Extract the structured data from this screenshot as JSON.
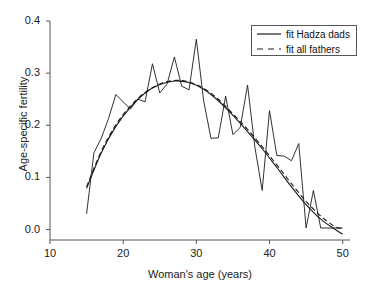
{
  "chart_data": {
    "type": "line",
    "title": "",
    "xlabel": "Woman's age (years)",
    "ylabel": "Age-specific fertility",
    "xlim": [
      10,
      51
    ],
    "ylim": [
      -0.02,
      0.4
    ],
    "xticks": [
      10,
      20,
      30,
      40,
      50
    ],
    "xtick_labels": [
      "10",
      "20",
      "30",
      "40",
      "50"
    ],
    "yticks": [
      0.0,
      0.1,
      0.2,
      0.3,
      0.4
    ],
    "ytick_labels": [
      "0.0",
      "0.1",
      "0.2",
      "0.3",
      "0.4"
    ],
    "grid": false,
    "legend_position": "top-right",
    "legend": [
      {
        "label": "fit Hadza dads",
        "style": "solid"
      },
      {
        "label": "fit all fathers",
        "style": "dashed"
      }
    ],
    "series": [
      {
        "name": "observed age-specific fertility",
        "style": "solid-jagged",
        "x": [
          15,
          16,
          17,
          18,
          19,
          20,
          21,
          22,
          23,
          24,
          25,
          26,
          27,
          28,
          29,
          30,
          31,
          32,
          33,
          34,
          35,
          36,
          37,
          38,
          39,
          40,
          41,
          42,
          43,
          44,
          45,
          46,
          47,
          48,
          49,
          50
        ],
        "y": [
          0.03,
          0.147,
          0.175,
          0.213,
          0.259,
          0.245,
          0.231,
          0.25,
          0.245,
          0.318,
          0.262,
          0.279,
          0.331,
          0.275,
          0.268,
          0.365,
          0.247,
          0.175,
          0.176,
          0.256,
          0.182,
          0.196,
          0.277,
          0.158,
          0.075,
          0.228,
          0.142,
          0.141,
          0.132,
          0.165,
          0.003,
          0.075,
          0.003,
          0.003,
          0.003,
          0.003
        ]
      },
      {
        "name": "fit Hadza dads",
        "style": "solid",
        "x": [
          15,
          17,
          19,
          21,
          23,
          25,
          27,
          29,
          31,
          33,
          35,
          37,
          39,
          41,
          43,
          45,
          47,
          49,
          50
        ],
        "y": [
          0.079,
          0.147,
          0.198,
          0.235,
          0.262,
          0.278,
          0.285,
          0.282,
          0.269,
          0.247,
          0.219,
          0.188,
          0.155,
          0.119,
          0.082,
          0.048,
          0.02,
          0.0,
          -0.009
        ]
      },
      {
        "name": "fit all fathers",
        "style": "dashed",
        "x": [
          15,
          17,
          19,
          21,
          23,
          25,
          27,
          29,
          31,
          33,
          35,
          37,
          39,
          41,
          43,
          45,
          47,
          49,
          50
        ],
        "y": [
          0.082,
          0.15,
          0.201,
          0.237,
          0.263,
          0.279,
          0.286,
          0.283,
          0.271,
          0.25,
          0.222,
          0.192,
          0.159,
          0.124,
          0.088,
          0.054,
          0.026,
          0.005,
          0.003
        ]
      }
    ]
  },
  "colors": {
    "axis": "#555555",
    "line": "#1a1a1a",
    "text": "#222222",
    "background": "#ffffff"
  }
}
